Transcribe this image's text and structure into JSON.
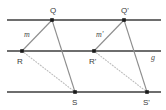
{
  "figure": {
    "type": "geometry-diagram",
    "width": 166,
    "height": 110,
    "background_color": "#ffffff",
    "line_color": "#6e6e6e",
    "segment_color": "#8a8a8a",
    "dotted_color": "#b9b9b9",
    "point_color": "#1a1a1a",
    "label_color": "#3a3a3a",
    "parallel_lines": [
      {
        "name": "top-line",
        "y": 20,
        "x1": 7,
        "x2": 161
      },
      {
        "name": "middle-line",
        "y": 51,
        "x1": 7,
        "x2": 161,
        "label": "g"
      },
      {
        "name": "bottom-line",
        "y": 92,
        "x1": 7,
        "x2": 161
      }
    ],
    "points": [
      {
        "id": "Q",
        "label": "Q",
        "x": 52,
        "y": 20,
        "label_x": 50,
        "label_y": 13
      },
      {
        "id": "Qp",
        "label": "Q'",
        "x": 124,
        "y": 20,
        "label_x": 121,
        "label_y": 13
      },
      {
        "id": "R",
        "label": "R",
        "x": 22,
        "y": 51,
        "label_x": 17,
        "label_y": 64
      },
      {
        "id": "Rp",
        "label": "R'",
        "x": 94,
        "y": 51,
        "label_x": 89,
        "label_y": 64
      },
      {
        "id": "S",
        "label": "S",
        "x": 75,
        "y": 92,
        "label_x": 72,
        "label_y": 105
      },
      {
        "id": "Sp",
        "label": "S'",
        "x": 147,
        "y": 92,
        "label_x": 143,
        "label_y": 105
      }
    ],
    "solid_segments": [
      {
        "name": "segment-RQ",
        "x1": 22,
        "y1": 51,
        "x2": 52,
        "y2": 20
      },
      {
        "name": "segment-QS",
        "x1": 52,
        "y1": 20,
        "x2": 75,
        "y2": 92
      },
      {
        "name": "segment-RpQp",
        "x1": 94,
        "y1": 51,
        "x2": 124,
        "y2": 20
      },
      {
        "name": "segment-QpSp",
        "x1": 124,
        "y1": 20,
        "x2": 147,
        "y2": 92
      }
    ],
    "dotted_segments": [
      {
        "name": "segment-RS",
        "x1": 22,
        "y1": 51,
        "x2": 75,
        "y2": 92
      },
      {
        "name": "segment-RpSp",
        "x1": 94,
        "y1": 51,
        "x2": 147,
        "y2": 92
      }
    ],
    "segment_labels": [
      {
        "id": "m",
        "label": "m",
        "x": 24,
        "y": 37
      },
      {
        "id": "mp",
        "label": "m'",
        "x": 96,
        "y": 37
      }
    ],
    "line_labels": [
      {
        "id": "g",
        "label": "g",
        "x": 151,
        "y": 60
      }
    ]
  }
}
